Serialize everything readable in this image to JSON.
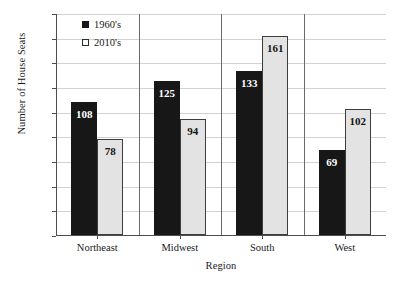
{
  "chart_data": {
    "type": "bar",
    "title": "",
    "xlabel": "Region",
    "ylabel": "Number of House Seats",
    "categories": [
      "Northeast",
      "Midwest",
      "South",
      "West"
    ],
    "series": [
      {
        "name": "1960's",
        "values": [
          108,
          125,
          133,
          69
        ],
        "color": "#171717",
        "marker": "filled-square"
      },
      {
        "name": "2010's",
        "values": [
          78,
          94,
          161,
          102
        ],
        "color": "#e3e3e3",
        "marker": "open-square"
      }
    ],
    "ylim": [
      0,
      180
    ],
    "ytick_step": 20,
    "yticks": [
      180,
      160,
      140,
      120,
      100,
      80,
      60,
      40,
      20,
      0
    ],
    "grid": true,
    "grid_axis": "y",
    "legend_position": "top-left-inside",
    "data_labels": true
  },
  "axis": {
    "y_title": "Number of House Seats",
    "x_title": "Region"
  },
  "legend": {
    "entries": [
      {
        "label": "1960's",
        "swatch": "filled-square-icon"
      },
      {
        "label": "2010's",
        "swatch": "open-square-icon"
      }
    ]
  }
}
